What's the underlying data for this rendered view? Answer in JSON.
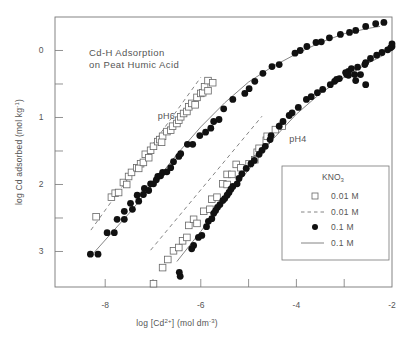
{
  "chart_data": {
    "type": "scatter",
    "title": "Cd-H Adsorption on Peat Humic Acid",
    "title_lines": [
      "Cd-H Adsorption",
      "on Peat Humic Acid"
    ],
    "xlabel": "log [Cd2+] (mol dm-3)",
    "xlabel_parts": {
      "pre": "log [Cd",
      "sup1": "2+",
      "mid": "] (mol dm",
      "sup2": "-3",
      "post": ")"
    },
    "ylabel": "log Cd adsorbed (mol kg-1)",
    "ylabel_parts": {
      "pre": "log Cd adsorbed (mol kg",
      "sup": "-1",
      "post": ")"
    },
    "xlim": [
      -9.05,
      -2
    ],
    "ylim": [
      3.53,
      -0.5
    ],
    "y_axis_inverted": true,
    "x_ticks": [
      -8,
      -6,
      -4,
      -2
    ],
    "x_tick_labels": [
      "-8",
      "-6",
      "-4",
      "-2"
    ],
    "x_minor_ticks": [
      -7,
      -5,
      -3
    ],
    "y_ticks": [
      0,
      1,
      2,
      3
    ],
    "y_tick_labels": [
      "0",
      "1",
      "2",
      "3"
    ],
    "y_minor_ticks": [
      0.5,
      1.5,
      2.5
    ],
    "grid": false,
    "annotations": [
      {
        "text": "pH6",
        "x": -6.9,
        "y": 1.02
      },
      {
        "text": "pH4",
        "x": -4.15,
        "y": 1.37
      }
    ],
    "legend": {
      "title": "KNO",
      "title_sub": "3",
      "position": "lower right",
      "entries": [
        {
          "marker": "open-square",
          "label": "0.01 M"
        },
        {
          "marker": "dashed-line",
          "label": "0.01 M"
        },
        {
          "marker": "filled-circle",
          "label": "0.1 M"
        },
        {
          "marker": "solid-line",
          "label": "0.1 M"
        }
      ]
    },
    "series": [
      {
        "name": "pH6 0.01 M KNO3 (data)",
        "marker": "open-square",
        "points": [
          [
            -8.19,
            2.48
          ],
          [
            -7.87,
            2.19
          ],
          [
            -7.79,
            2.13
          ],
          [
            -7.72,
            2.12
          ],
          [
            -7.62,
            1.97
          ],
          [
            -7.55,
            2.0
          ],
          [
            -7.51,
            1.88
          ],
          [
            -7.45,
            1.82
          ],
          [
            -7.34,
            1.75
          ],
          [
            -7.26,
            1.69
          ],
          [
            -7.3,
            1.76
          ],
          [
            -7.2,
            1.67
          ],
          [
            -7.16,
            1.55
          ],
          [
            -7.09,
            1.6
          ],
          [
            -7.05,
            1.49
          ],
          [
            -6.99,
            1.43
          ],
          [
            -6.9,
            1.36
          ],
          [
            -6.86,
            1.33
          ],
          [
            -6.8,
            1.28
          ],
          [
            -6.82,
            1.37
          ],
          [
            -6.71,
            1.21
          ],
          [
            -6.63,
            1.19
          ],
          [
            -6.59,
            1.13
          ],
          [
            -6.5,
            1.09
          ],
          [
            -6.46,
            1.04
          ],
          [
            -6.42,
            0.99
          ],
          [
            -6.36,
            0.94
          ],
          [
            -6.29,
            0.91
          ],
          [
            -6.25,
            0.84
          ],
          [
            -6.19,
            0.79
          ],
          [
            -6.12,
            0.81
          ],
          [
            -6.08,
            0.7
          ],
          [
            -6.0,
            0.64
          ],
          [
            -5.96,
            0.63
          ],
          [
            -5.92,
            0.54
          ],
          [
            -5.85,
            0.6
          ],
          [
            -5.85,
            0.45
          ],
          [
            -5.75,
            0.48
          ]
        ]
      },
      {
        "name": "pH6 0.1 M KNO3 (data)",
        "marker": "filled-circle",
        "points": [
          [
            -8.31,
            3.04
          ],
          [
            -8.15,
            3.04
          ],
          [
            -7.96,
            2.72
          ],
          [
            -7.81,
            2.72
          ],
          [
            -7.75,
            2.52
          ],
          [
            -7.6,
            2.52
          ],
          [
            -7.6,
            2.4
          ],
          [
            -7.43,
            2.37
          ],
          [
            -7.47,
            2.28
          ],
          [
            -7.3,
            2.25
          ],
          [
            -7.33,
            2.16
          ],
          [
            -7.2,
            2.15
          ],
          [
            -7.18,
            2.06
          ],
          [
            -7.09,
            2.09
          ],
          [
            -7.05,
            1.99
          ],
          [
            -6.99,
            1.99
          ],
          [
            -6.93,
            1.93
          ],
          [
            -6.9,
            1.88
          ],
          [
            -6.84,
            1.87
          ],
          [
            -6.8,
            1.82
          ],
          [
            -6.71,
            1.81
          ],
          [
            -6.63,
            1.75
          ],
          [
            -6.57,
            1.66
          ],
          [
            -6.46,
            1.58
          ],
          [
            -6.42,
            1.54
          ],
          [
            -6.28,
            1.4
          ],
          [
            -6.17,
            1.4
          ],
          [
            -6.02,
            1.27
          ],
          [
            -5.9,
            1.22
          ],
          [
            -5.79,
            1.16
          ],
          [
            -5.73,
            1.06
          ],
          [
            -5.62,
            1.03
          ],
          [
            -5.52,
            0.87
          ],
          [
            -5.33,
            0.73
          ],
          [
            -5.08,
            0.64
          ],
          [
            -4.99,
            0.57
          ],
          [
            -4.87,
            0.46
          ],
          [
            -4.7,
            0.34
          ],
          [
            -4.51,
            0.24
          ],
          [
            -4.36,
            0.21
          ],
          [
            -4.03,
            0.04
          ],
          [
            -3.92,
            0.0
          ],
          [
            -3.78,
            -0.06
          ],
          [
            -3.59,
            -0.12
          ],
          [
            -3.48,
            -0.13
          ],
          [
            -3.31,
            -0.19
          ],
          [
            -3.08,
            -0.24
          ],
          [
            -2.89,
            -0.27
          ],
          [
            -2.76,
            -0.3
          ],
          [
            -2.55,
            -0.36
          ],
          [
            -2.34,
            -0.4
          ],
          [
            -2.17,
            -0.42
          ]
        ]
      },
      {
        "name": "pH4 0.01 M KNO3 (data)",
        "marker": "open-square",
        "points": [
          [
            -6.99,
            3.48
          ],
          [
            -6.8,
            3.24
          ],
          [
            -6.69,
            3.12
          ],
          [
            -6.57,
            2.99
          ],
          [
            -6.46,
            2.94
          ],
          [
            -6.38,
            2.84
          ],
          [
            -6.29,
            2.79
          ],
          [
            -6.25,
            2.61
          ],
          [
            -6.15,
            2.52
          ],
          [
            -6.08,
            2.58
          ],
          [
            -5.94,
            2.4
          ],
          [
            -5.81,
            2.37
          ],
          [
            -5.77,
            2.22
          ],
          [
            -5.66,
            2.19
          ],
          [
            -5.54,
            1.99
          ],
          [
            -5.45,
            2.0
          ],
          [
            -5.45,
            1.85
          ],
          [
            -5.35,
            1.85
          ],
          [
            -5.26,
            1.7
          ],
          [
            -5.16,
            1.75
          ],
          [
            -4.99,
            1.69
          ],
          [
            -4.87,
            1.63
          ],
          [
            -4.82,
            1.52
          ],
          [
            -4.78,
            1.46
          ],
          [
            -4.63,
            1.34
          ],
          [
            -4.61,
            1.28
          ],
          [
            -4.44,
            1.18
          ],
          [
            -4.3,
            1.13
          ]
        ]
      },
      {
        "name": "pH4 0.1 M KNO3 (data)",
        "marker": "filled-circle",
        "points": [
          [
            -6.45,
            3.31
          ],
          [
            -6.43,
            3.37
          ],
          [
            -6.19,
            2.96
          ],
          [
            -6.15,
            2.91
          ],
          [
            -6.05,
            2.79
          ],
          [
            -5.98,
            2.76
          ],
          [
            -5.88,
            2.63
          ],
          [
            -5.84,
            2.55
          ],
          [
            -5.77,
            2.51
          ],
          [
            -5.73,
            2.43
          ],
          [
            -5.69,
            2.39
          ],
          [
            -5.65,
            2.34
          ],
          [
            -5.6,
            2.3
          ],
          [
            -5.54,
            2.24
          ],
          [
            -5.5,
            2.21
          ],
          [
            -5.45,
            2.16
          ],
          [
            -5.41,
            2.12
          ],
          [
            -5.37,
            2.07
          ],
          [
            -5.33,
            2.03
          ],
          [
            -5.24,
            1.99
          ],
          [
            -5.2,
            1.91
          ],
          [
            -5.14,
            1.84
          ],
          [
            -5.05,
            1.76
          ],
          [
            -4.95,
            1.69
          ],
          [
            -4.88,
            1.64
          ],
          [
            -4.78,
            1.55
          ],
          [
            -4.72,
            1.49
          ],
          [
            -4.65,
            1.43
          ],
          [
            -4.55,
            1.33
          ],
          [
            -4.53,
            1.27
          ],
          [
            -4.36,
            1.13
          ],
          [
            -4.28,
            1.06
          ],
          [
            -4.15,
            0.97
          ],
          [
            -4.09,
            0.93
          ],
          [
            -3.96,
            0.85
          ],
          [
            -3.79,
            0.73
          ],
          [
            -3.69,
            0.69
          ],
          [
            -3.56,
            0.63
          ],
          [
            -3.45,
            0.58
          ],
          [
            -3.29,
            0.51
          ],
          [
            -3.2,
            0.46
          ],
          [
            -3.1,
            0.42
          ],
          [
            -2.95,
            0.36
          ],
          [
            -2.91,
            0.31
          ],
          [
            -2.85,
            0.27
          ],
          [
            -2.72,
            0.25
          ],
          [
            -2.57,
            0.21
          ],
          [
            -2.55,
            0.18
          ],
          [
            -2.45,
            0.12
          ],
          [
            -2.32,
            0.07
          ],
          [
            -2.21,
            0.03
          ],
          [
            -2.09,
            -0.01
          ],
          [
            -2.03,
            -0.04
          ],
          [
            -2.0,
            -0.06
          ],
          [
            -2.0,
            -0.1
          ],
          [
            -2.76,
            0.45
          ],
          [
            -2.55,
            0.51
          ],
          [
            -2.66,
            0.36
          ],
          [
            -2.78,
            0.36
          ],
          [
            -2.91,
            0.37
          ],
          [
            -2.97,
            0.33
          ],
          [
            -3.16,
            0.43
          ]
        ]
      },
      {
        "name": "pH6 0.01 M KNO3 (model)",
        "style": "dashed",
        "points": [
          [
            -8.3,
            2.68
          ],
          [
            -6.0,
            0.4
          ]
        ]
      },
      {
        "name": "pH6 0.1 M KNO3 (model)",
        "style": "solid",
        "points": [
          [
            -8.25,
            3.03
          ],
          [
            -7.5,
            2.43
          ],
          [
            -7.0,
            2.0
          ],
          [
            -6.5,
            1.55
          ],
          [
            -6.0,
            1.14
          ],
          [
            -5.5,
            0.78
          ],
          [
            -5.0,
            0.47
          ],
          [
            -4.5,
            0.24
          ],
          [
            -4.0,
            0.05
          ],
          [
            -3.5,
            -0.12
          ],
          [
            -3.0,
            -0.25
          ],
          [
            -2.5,
            -0.33
          ],
          [
            -2.25,
            -0.36
          ]
        ]
      },
      {
        "name": "pH4 0.01 M KNO3 (model)",
        "style": "dashed",
        "points": [
          [
            -7.05,
            2.98
          ],
          [
            -4.72,
            0.98
          ]
        ]
      },
      {
        "name": "pH4 0.1 M KNO3 (model)",
        "style": "solid",
        "points": [
          [
            -6.5,
            3.15
          ],
          [
            -6.0,
            2.7
          ],
          [
            -5.5,
            2.23
          ],
          [
            -5.0,
            1.78
          ],
          [
            -4.5,
            1.33
          ],
          [
            -4.0,
            0.95
          ],
          [
            -3.5,
            0.64
          ],
          [
            -3.0,
            0.4
          ],
          [
            -2.5,
            0.19
          ],
          [
            -2.15,
            0.06
          ]
        ]
      }
    ]
  },
  "plot": {
    "frame": {
      "left": 55,
      "right": 392,
      "top": 17,
      "bottom": 287
    },
    "colors": {
      "axis": "#777777",
      "marker": "#111111",
      "open_marker_stroke": "#666666",
      "text": "#555555",
      "line": "#666666"
    }
  }
}
